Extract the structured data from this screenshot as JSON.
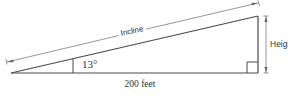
{
  "diagram": {
    "labels": {
      "incline": "Incline",
      "height": "Height",
      "base": "200 feet",
      "angle": "13°"
    },
    "values": {
      "base_length_feet": 200,
      "angle_degrees": 13
    },
    "colors": {
      "stroke": "#4a4a4a",
      "dimension_stroke": "#6a6a6a",
      "text": "#333333",
      "background": "#ffffff"
    }
  }
}
